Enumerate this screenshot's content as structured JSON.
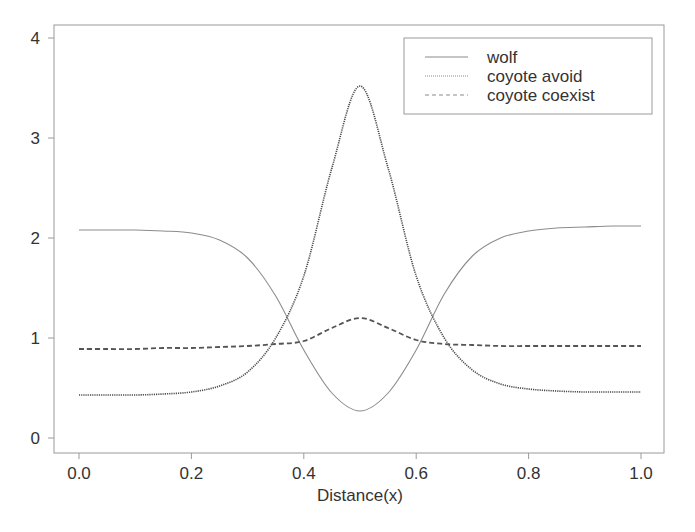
{
  "chart_data": {
    "type": "line",
    "title": "",
    "xlabel": "Distance(x)",
    "ylabel": "",
    "xlim": [
      0.0,
      1.0
    ],
    "ylim": [
      -0.1,
      4.15
    ],
    "x_ticks": [
      "0.0",
      "0.2",
      "0.4",
      "0.6",
      "0.8",
      "1.0"
    ],
    "y_ticks": [
      "0",
      "1",
      "2",
      "3",
      "4"
    ],
    "grid": false,
    "legend_position": "upper right",
    "x": [
      0.0,
      0.05,
      0.1,
      0.15,
      0.2,
      0.25,
      0.3,
      0.35,
      0.4,
      0.45,
      0.5,
      0.55,
      0.6,
      0.65,
      0.7,
      0.75,
      0.8,
      0.85,
      0.9,
      0.95,
      1.0
    ],
    "series": [
      {
        "name": "wolf",
        "style": "solid",
        "values": [
          2.08,
          2.08,
          2.08,
          2.07,
          2.05,
          1.98,
          1.8,
          1.42,
          0.88,
          0.45,
          0.27,
          0.45,
          0.88,
          1.44,
          1.82,
          2.0,
          2.07,
          2.1,
          2.11,
          2.12,
          2.12
        ]
      },
      {
        "name": "coyote avoid",
        "style": "dotted",
        "values": [
          0.43,
          0.43,
          0.43,
          0.44,
          0.46,
          0.52,
          0.66,
          1.0,
          1.62,
          2.7,
          3.52,
          2.7,
          1.62,
          1.0,
          0.68,
          0.54,
          0.49,
          0.47,
          0.46,
          0.46,
          0.46
        ]
      },
      {
        "name": "coyote coexist",
        "style": "dashed",
        "values": [
          0.89,
          0.89,
          0.89,
          0.9,
          0.9,
          0.91,
          0.92,
          0.94,
          0.97,
          1.1,
          1.2,
          1.1,
          0.98,
          0.94,
          0.93,
          0.92,
          0.92,
          0.92,
          0.92,
          0.92,
          0.92
        ]
      }
    ]
  },
  "legend": {
    "items": [
      "wolf",
      "coyote avoid",
      "coyote coexist"
    ]
  }
}
